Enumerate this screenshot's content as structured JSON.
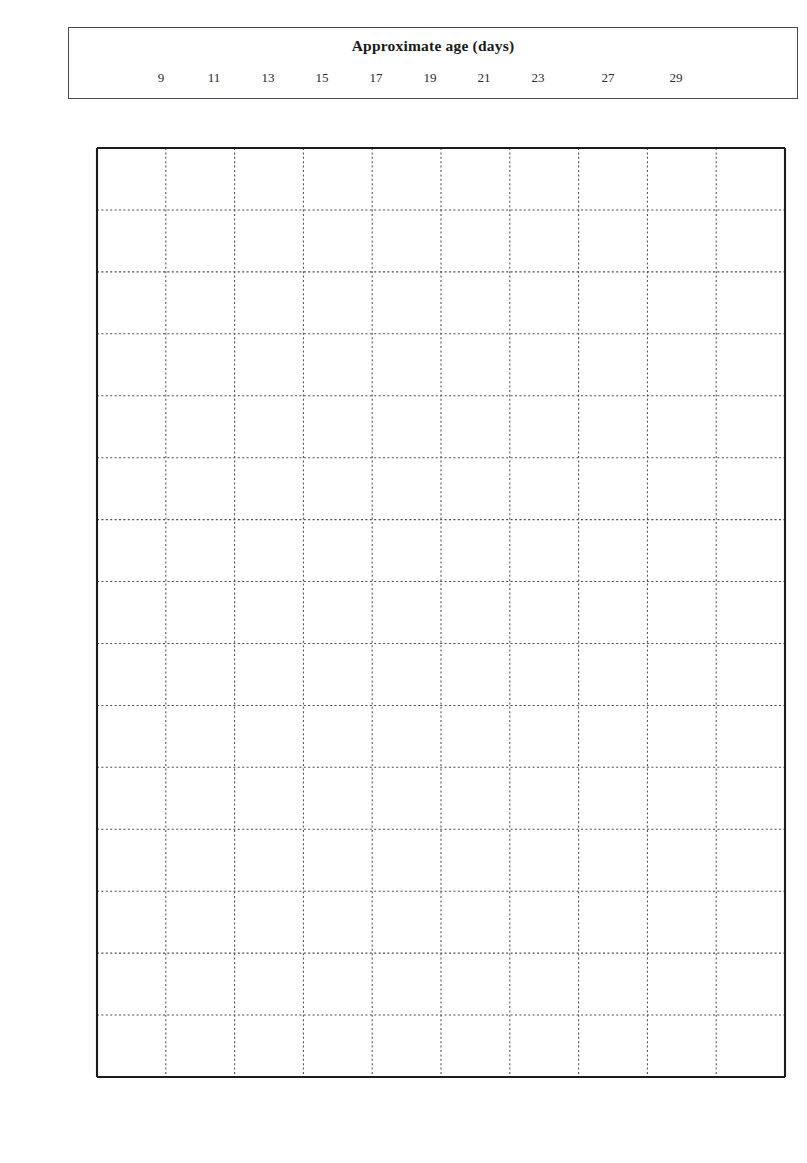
{
  "age_axis": {
    "title": "Approximate age (days)",
    "tick_labels": [
      "9",
      "11",
      "13",
      "15",
      "17",
      "19",
      "21",
      "23",
      "27",
      "29"
    ],
    "tick_x_px": [
      160,
      213,
      267,
      321,
      375,
      429,
      483,
      537,
      607,
      675
    ]
  },
  "colors": {
    "female": "#f03a1e",
    "male": "#7ecbef",
    "curve": "#1b1b1b",
    "grid": "#4d4d4d",
    "axis": "#1c1c1c"
  },
  "chart_data": {
    "type": "scatter",
    "title": "",
    "xlabel": "Length of outermost primary (mm)",
    "ylabel": "Mass (g)",
    "xlim": [
      0,
      100
    ],
    "ylim": [
      0,
      300
    ],
    "x_ticks": [
      0,
      10,
      20,
      30,
      40,
      50,
      60,
      70,
      80,
      90,
      100
    ],
    "y_ticks": [
      0,
      20,
      40,
      60,
      80,
      100,
      120,
      140,
      160,
      180,
      200,
      220,
      240,
      260,
      280,
      300
    ],
    "x_minor_step": 2,
    "y_minor_step": 5,
    "grid": true,
    "legend_position": "center",
    "series": [
      {
        "name": "Female",
        "marker": "square",
        "color": "#f03a1e",
        "points": [
          [
            5,
            60
          ],
          [
            5.5,
            57
          ],
          [
            8,
            83
          ],
          [
            9,
            120
          ],
          [
            9.5,
            115
          ],
          [
            10,
            129
          ],
          [
            16,
            160
          ],
          [
            16.5,
            157
          ],
          [
            17,
            155
          ],
          [
            17,
            145
          ],
          [
            18,
            152
          ],
          [
            18.5,
            168
          ],
          [
            19,
            178
          ],
          [
            20,
            181
          ],
          [
            21,
            175
          ],
          [
            25,
            182
          ],
          [
            26,
            190
          ],
          [
            27,
            196
          ],
          [
            28,
            193
          ],
          [
            29,
            183
          ],
          [
            29.5,
            181
          ],
          [
            30,
            186
          ],
          [
            30.5,
            200
          ],
          [
            31,
            201
          ],
          [
            31.5,
            204
          ],
          [
            32,
            183
          ],
          [
            33,
            185
          ],
          [
            33.5,
            206
          ],
          [
            34,
            208
          ],
          [
            34.5,
            213
          ],
          [
            35,
            253
          ],
          [
            35,
            228
          ],
          [
            35.5,
            219
          ],
          [
            36,
            202
          ],
          [
            36.5,
            198
          ],
          [
            37,
            227
          ],
          [
            37.5,
            221
          ],
          [
            38,
            231
          ],
          [
            38.5,
            192
          ],
          [
            39,
            208
          ],
          [
            39.5,
            213
          ],
          [
            40,
            214
          ],
          [
            40.5,
            220
          ],
          [
            41,
            224
          ],
          [
            41.5,
            233
          ],
          [
            42,
            244
          ],
          [
            42.5,
            240
          ],
          [
            43,
            241
          ],
          [
            43.5,
            235
          ],
          [
            44,
            196
          ],
          [
            45,
            213
          ],
          [
            46,
            228
          ],
          [
            47,
            206
          ],
          [
            48,
            234
          ],
          [
            48.5,
            239
          ],
          [
            49,
            243
          ],
          [
            49.5,
            231
          ],
          [
            50,
            232
          ],
          [
            50.5,
            229
          ],
          [
            51,
            236
          ],
          [
            51.5,
            245
          ],
          [
            52,
            226
          ],
          [
            52.5,
            222
          ],
          [
            53,
            230
          ],
          [
            53.5,
            235
          ],
          [
            54,
            231
          ],
          [
            54.5,
            238
          ],
          [
            55,
            225
          ],
          [
            55.5,
            229
          ],
          [
            56,
            243
          ],
          [
            57,
            234
          ],
          [
            57.5,
            228
          ],
          [
            58,
            241
          ],
          [
            59,
            240
          ],
          [
            60,
            239
          ],
          [
            61,
            247
          ],
          [
            61.5,
            243
          ],
          [
            62,
            233
          ],
          [
            63,
            249
          ],
          [
            64,
            251
          ],
          [
            64.5,
            244
          ],
          [
            65,
            248
          ],
          [
            66,
            251
          ],
          [
            67,
            239
          ],
          [
            68,
            263
          ],
          [
            69,
            232
          ],
          [
            70,
            244
          ],
          [
            71,
            289
          ],
          [
            71.5,
            258
          ],
          [
            72,
            263
          ],
          [
            72.5,
            240
          ],
          [
            73,
            241
          ],
          [
            73.5,
            236
          ],
          [
            74,
            231
          ],
          [
            75,
            234
          ],
          [
            76,
            243
          ],
          [
            77,
            238
          ],
          [
            78,
            247
          ],
          [
            79,
            233
          ],
          [
            80,
            253
          ],
          [
            80.5,
            241
          ],
          [
            82,
            248
          ],
          [
            88,
            221
          ]
        ]
      },
      {
        "name": "Male",
        "marker": "circle",
        "color": "#7ecbef",
        "points": [
          [
            3,
            35
          ],
          [
            5,
            50
          ],
          [
            5.5,
            55
          ],
          [
            5.5,
            62
          ],
          [
            6,
            61
          ],
          [
            6,
            74
          ],
          [
            7,
            87
          ],
          [
            8,
            100
          ],
          [
            9.5,
            108
          ],
          [
            10,
            113
          ],
          [
            10.5,
            112
          ],
          [
            12,
            124
          ],
          [
            13,
            131
          ],
          [
            14,
            132
          ],
          [
            15,
            129
          ],
          [
            15.5,
            134
          ],
          [
            16,
            136
          ],
          [
            16.5,
            133
          ],
          [
            17,
            131
          ],
          [
            17,
            126
          ],
          [
            18,
            140
          ],
          [
            18.5,
            142
          ],
          [
            19,
            143
          ],
          [
            19.5,
            138
          ],
          [
            20,
            147
          ],
          [
            21,
            146
          ],
          [
            21.5,
            152
          ],
          [
            22,
            150
          ],
          [
            23,
            155
          ],
          [
            24,
            159
          ],
          [
            24.5,
            163
          ],
          [
            25,
            157
          ],
          [
            25.5,
            156
          ],
          [
            26,
            166
          ],
          [
            26.5,
            170
          ],
          [
            27,
            135
          ],
          [
            27.5,
            172
          ],
          [
            28,
            168
          ],
          [
            28.5,
            174
          ],
          [
            29,
            160
          ],
          [
            29.5,
            155
          ],
          [
            30,
            177
          ],
          [
            30.5,
            181
          ],
          [
            31,
            165
          ],
          [
            32,
            183
          ],
          [
            33,
            180
          ],
          [
            34,
            178
          ],
          [
            34.5,
            173
          ],
          [
            35,
            186
          ],
          [
            36,
            188
          ],
          [
            36.5,
            183
          ],
          [
            37,
            190
          ],
          [
            37.5,
            181
          ],
          [
            38,
            166
          ],
          [
            39,
            185
          ],
          [
            39.5,
            205
          ],
          [
            40,
            194
          ],
          [
            40.5,
            187
          ],
          [
            41,
            179
          ],
          [
            42,
            184
          ],
          [
            42.5,
            192
          ],
          [
            43,
            186
          ],
          [
            43.5,
            180
          ],
          [
            44,
            190
          ],
          [
            44.5,
            188
          ],
          [
            45,
            183
          ],
          [
            46,
            197
          ],
          [
            46.5,
            187
          ],
          [
            47,
            176
          ],
          [
            48,
            185
          ],
          [
            48.5,
            192
          ],
          [
            49,
            179
          ],
          [
            49.5,
            188
          ],
          [
            50,
            183
          ],
          [
            50.5,
            198
          ],
          [
            51,
            190
          ],
          [
            51.5,
            186
          ],
          [
            52,
            208
          ],
          [
            52.5,
            195
          ],
          [
            53,
            188
          ],
          [
            53.5,
            184
          ],
          [
            54,
            207
          ],
          [
            54.5,
            200
          ],
          [
            55,
            189
          ],
          [
            55.5,
            193
          ],
          [
            56,
            208
          ],
          [
            56.5,
            198
          ],
          [
            57,
            187
          ],
          [
            57.5,
            182
          ],
          [
            58,
            191
          ],
          [
            58.5,
            196
          ],
          [
            59,
            185
          ],
          [
            60,
            190
          ],
          [
            60.5,
            203
          ],
          [
            61,
            189
          ],
          [
            61.5,
            186
          ],
          [
            62,
            194
          ],
          [
            62.5,
            180
          ],
          [
            63,
            173
          ],
          [
            64,
            198
          ],
          [
            64.5,
            191
          ],
          [
            65,
            205
          ],
          [
            66,
            186
          ],
          [
            67,
            193
          ],
          [
            68,
            177
          ],
          [
            69,
            186
          ],
          [
            70,
            196
          ],
          [
            70.5,
            191
          ],
          [
            71,
            183
          ],
          [
            71.5,
            186
          ],
          [
            72,
            181
          ],
          [
            72.5,
            199
          ],
          [
            73,
            204
          ],
          [
            73.5,
            190
          ],
          [
            74,
            186
          ],
          [
            74.5,
            172
          ],
          [
            75,
            193
          ],
          [
            76,
            183
          ],
          [
            77,
            190
          ],
          [
            78,
            180
          ],
          [
            79,
            183
          ],
          [
            80,
            158
          ],
          [
            84,
            170
          ]
        ]
      }
    ],
    "fit_curves": [
      {
        "name": "female-fit",
        "for_series": "Female",
        "points": [
          [
            1,
            45
          ],
          [
            5,
            85
          ],
          [
            10,
            122
          ],
          [
            15,
            151
          ],
          [
            20,
            173
          ],
          [
            25,
            190
          ],
          [
            30,
            202
          ],
          [
            35,
            212
          ],
          [
            40,
            221
          ],
          [
            45,
            229
          ],
          [
            50,
            235
          ],
          [
            55,
            239
          ],
          [
            60,
            242
          ],
          [
            65,
            243
          ],
          [
            70,
            243
          ],
          [
            75,
            243
          ],
          [
            80,
            242
          ],
          [
            85,
            241
          ],
          [
            89,
            241
          ]
        ]
      },
      {
        "name": "male-fit",
        "for_series": "Male",
        "points": [
          [
            1,
            45
          ],
          [
            5,
            70
          ],
          [
            10,
            98
          ],
          [
            15,
            120
          ],
          [
            20,
            138
          ],
          [
            25,
            152
          ],
          [
            30,
            164
          ],
          [
            35,
            173
          ],
          [
            40,
            180
          ],
          [
            45,
            185
          ],
          [
            50,
            188
          ],
          [
            55,
            189
          ],
          [
            60,
            189
          ],
          [
            65,
            188
          ],
          [
            70,
            186
          ],
          [
            75,
            184
          ],
          [
            80,
            182
          ],
          [
            84,
            181
          ]
        ]
      }
    ],
    "legend": [
      {
        "label": "Female",
        "marker": "square",
        "color": "#f03a1e"
      },
      {
        "label": "Male",
        "marker": "circle",
        "color": "#7ecbef"
      }
    ]
  }
}
